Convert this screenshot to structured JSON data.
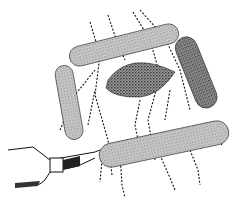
{
  "illustration": {
    "subject": "rod-shaped bacteria with flagella and micromanipulator probe",
    "colors": {
      "background": "#ffffff",
      "ink": "#111111",
      "stipple": "#6a6a6a"
    },
    "elements": {
      "bacteria_count": 5,
      "probe": "micropipette-tool"
    }
  }
}
